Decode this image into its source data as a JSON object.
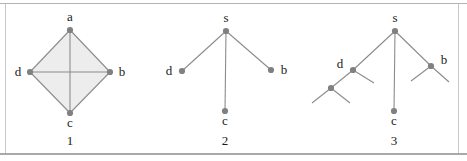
{
  "figure": {
    "width": 467,
    "height": 161,
    "background_color": "#ffffff",
    "rule_color": "#b3b3b3",
    "node_color": "#808080",
    "edge_color": "#8c8c8c",
    "fill_color": "#ededed",
    "label_color": "#1a1a1a"
  },
  "panels": [
    {
      "caption": "1",
      "caption_x": 70,
      "caption_y": 133,
      "type": "graph-complete-diamond",
      "nodes": [
        {
          "label": "a",
          "x": 70,
          "y": 30,
          "label_x": 70,
          "label_y": 10
        },
        {
          "label": "d",
          "x": 30,
          "y": 72,
          "label_x": 18,
          "label_y": 65
        },
        {
          "label": "b",
          "x": 110,
          "y": 72,
          "label_x": 122,
          "label_y": 65
        },
        {
          "label": "c",
          "x": 70,
          "y": 113,
          "label_x": 70,
          "label_y": 116
        }
      ],
      "edges": [
        {
          "from": "a",
          "to": "d"
        },
        {
          "from": "a",
          "to": "b"
        },
        {
          "from": "d",
          "to": "c"
        },
        {
          "from": "b",
          "to": "c"
        },
        {
          "from": "a",
          "to": "c"
        },
        {
          "from": "d",
          "to": "b"
        }
      ],
      "filled_polygon": [
        "a",
        "b",
        "c",
        "d"
      ]
    },
    {
      "caption": "2",
      "caption_x": 225,
      "caption_y": 133,
      "type": "star-tree-depth-1",
      "nodes": [
        {
          "label": "s",
          "x": 226,
          "y": 31,
          "label_x": 226,
          "label_y": 11
        },
        {
          "label": "d",
          "x": 182,
          "y": 71,
          "label_x": 169,
          "label_y": 64
        },
        {
          "label": "b",
          "x": 271,
          "y": 70,
          "label_x": 284,
          "label_y": 63
        },
        {
          "label": "c",
          "x": 225,
          "y": 111,
          "label_x": 225,
          "label_y": 114
        }
      ],
      "edges": [
        {
          "from": "s",
          "to": "d"
        },
        {
          "from": "s",
          "to": "b"
        },
        {
          "from": "s",
          "to": "c"
        }
      ]
    },
    {
      "caption": "3",
      "caption_x": 394,
      "caption_y": 133,
      "type": "tree-depth-2",
      "nodes": [
        {
          "label": "s",
          "x": 395,
          "y": 31,
          "label_x": 395,
          "label_y": 11
        },
        {
          "label": "d",
          "x": 353,
          "y": 70,
          "label_x": 340,
          "label_y": 57
        },
        {
          "label": "b",
          "x": 431,
          "y": 66,
          "label_x": 444,
          "label_y": 53
        },
        {
          "label": "c",
          "x": 394,
          "y": 111,
          "label_x": 394,
          "label_y": 114
        },
        {
          "label": "",
          "x": 331,
          "y": 88,
          "label_x": 0,
          "label_y": 0
        }
      ],
      "edges": [
        {
          "from": "s",
          "to": "d"
        },
        {
          "from": "s",
          "to": "b"
        },
        {
          "from": "s",
          "to": "c"
        }
      ],
      "stubs": [
        {
          "x1": 353,
          "y1": 70,
          "x2": 374,
          "y2": 83
        },
        {
          "x1": 353,
          "y1": 70,
          "x2": 331,
          "y2": 88
        },
        {
          "x1": 331,
          "y1": 88,
          "x2": 312,
          "y2": 103
        },
        {
          "x1": 331,
          "y1": 88,
          "x2": 350,
          "y2": 103
        },
        {
          "x1": 431,
          "y1": 66,
          "x2": 411,
          "y2": 81
        },
        {
          "x1": 431,
          "y1": 66,
          "x2": 449,
          "y2": 82
        }
      ]
    }
  ]
}
